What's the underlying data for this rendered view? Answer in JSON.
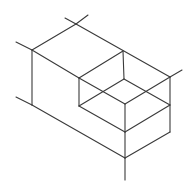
{
  "diagram": {
    "type": "isometric-line-drawing",
    "stroke_color": "#3a3a3a",
    "background": "#ffffff",
    "vertices": {
      "A": [
        76,
        24
      ],
      "B": [
        32,
        50
      ],
      "C": [
        123,
        51
      ],
      "D": [
        170,
        77
      ],
      "E": [
        79,
        78
      ],
      "F": [
        124,
        79
      ],
      "G": [
        125,
        104
      ],
      "H": [
        79,
        106
      ],
      "M": [
        170,
        105
      ],
      "I": [
        125,
        132
      ],
      "K": [
        170,
        132
      ],
      "L": [
        32,
        105
      ],
      "J": [
        125,
        158
      ]
    },
    "edges": [
      {
        "name": "top-left-edge",
        "x1": 76,
        "y1": 24,
        "x2": 32,
        "y2": 50
      },
      {
        "name": "top-back-edge",
        "x1": 76,
        "y1": 24,
        "x2": 170,
        "y2": 77
      },
      {
        "name": "ext-A-left",
        "x1": 76,
        "y1": 24,
        "x2": 65,
        "y2": 18
      },
      {
        "name": "ext-A-right",
        "x1": 76,
        "y1": 24,
        "x2": 88,
        "y2": 15
      },
      {
        "name": "ext-B",
        "x1": 32,
        "y1": 50,
        "x2": 16,
        "y2": 42
      },
      {
        "name": "left-vertical",
        "x1": 32,
        "y1": 50,
        "x2": 32,
        "y2": 105
      },
      {
        "name": "ext-L",
        "x1": 32,
        "y1": 105,
        "x2": 16,
        "y2": 97
      },
      {
        "name": "ext-D",
        "x1": 170,
        "y1": 77,
        "x2": 182,
        "y2": 70
      },
      {
        "name": "top-front-edge",
        "x1": 32,
        "y1": 50,
        "x2": 79,
        "y2": 78
      },
      {
        "name": "notch-top-edge",
        "x1": 79,
        "y1": 78,
        "x2": 123,
        "y2": 51
      },
      {
        "name": "notch-back-vertical",
        "x1": 123,
        "y1": 51,
        "x2": 124,
        "y2": 79
      },
      {
        "name": "notch-left-vertical",
        "x1": 79,
        "y1": 78,
        "x2": 79,
        "y2": 106
      },
      {
        "name": "notch-floor-diag-1",
        "x1": 79,
        "y1": 78,
        "x2": 125,
        "y2": 104
      },
      {
        "name": "notch-floor-diag-2",
        "x1": 124,
        "y1": 79,
        "x2": 79,
        "y2": 106
      },
      {
        "name": "notch-floor-diag-3",
        "x1": 124,
        "y1": 79,
        "x2": 170,
        "y2": 105
      },
      {
        "name": "notch-floor-diag-4",
        "x1": 170,
        "y1": 77,
        "x2": 125,
        "y2": 104
      },
      {
        "name": "right-vertical",
        "x1": 170,
        "y1": 77,
        "x2": 170,
        "y2": 132
      },
      {
        "name": "notch-front-vertical",
        "x1": 125,
        "y1": 104,
        "x2": 125,
        "y2": 132
      },
      {
        "name": "notch-lower-left",
        "x1": 79,
        "y1": 106,
        "x2": 125,
        "y2": 132
      },
      {
        "name": "notch-lower-right",
        "x1": 125,
        "y1": 132,
        "x2": 170,
        "y2": 105
      },
      {
        "name": "bottom-left-edge",
        "x1": 32,
        "y1": 105,
        "x2": 125,
        "y2": 158
      },
      {
        "name": "bottom-right-edge",
        "x1": 170,
        "y1": 132,
        "x2": 125,
        "y2": 158
      },
      {
        "name": "front-vertical",
        "x1": 125,
        "y1": 132,
        "x2": 125,
        "y2": 158
      },
      {
        "name": "ext-J",
        "x1": 125,
        "y1": 158,
        "x2": 125,
        "y2": 180
      }
    ]
  }
}
